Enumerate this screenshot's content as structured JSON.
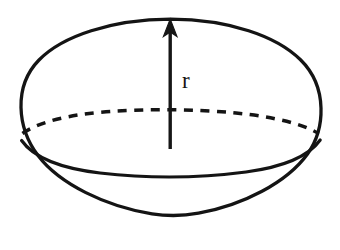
{
  "figure": {
    "kind": "sphere-radius-diagram",
    "background_color": "#ffffff",
    "ink_color": "#141414",
    "canvas": {
      "width": 340,
      "height": 250
    },
    "label": {
      "text": "r",
      "meaning": "radius",
      "x": 189,
      "y": 82
    },
    "outline": {
      "name": "sphere-outline-ellipse",
      "center_x": 170,
      "center_y": 128,
      "radius_x": 150,
      "radius_y": 110,
      "stroke_width": 3.2,
      "style": "solid"
    },
    "back_equator": {
      "name": "equator-back-arc",
      "style": "dashed",
      "dash_pattern": "9 7",
      "stroke_width": 3.4,
      "start_x": 21,
      "start_y": 134,
      "peak_y": 113,
      "end_x": 319,
      "end_y": 134
    },
    "front_equator": {
      "name": "equator-front-arc",
      "style": "solid",
      "stroke_width": 3.2,
      "start_x": 21,
      "start_y": 142,
      "dip_y": 168,
      "end_x": 319,
      "end_y": 142
    },
    "radius_arrow": {
      "name": "radius-arrow",
      "orientation": "vertical-up",
      "x": 170,
      "tail_y": 149,
      "tip_y": 20,
      "shaft_width": 3.4,
      "head_width": 13,
      "head_length": 15
    }
  }
}
